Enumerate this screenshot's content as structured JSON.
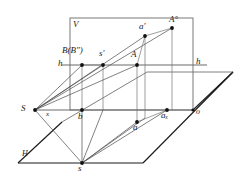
{
  "figure": {
    "type": "descriptive-geometry-diagram",
    "background_color": "#ffffff",
    "line_color": "#3c3c3c",
    "heavy_line_color": "#1a1a1a",
    "point_color": "#111111",
    "label_color": "#1a1a1a"
  },
  "planes": {
    "picture_plane": {
      "label": "V",
      "label_x": 73,
      "label_y": 20,
      "rect": {
        "x": 70,
        "y": 18,
        "w": 123,
        "h": 92
      }
    },
    "ground_plane": {
      "label": "H",
      "label_x": 22,
      "label_y": 152,
      "polygon": "193,110 233,72 147,72 18,163 143,163"
    }
  },
  "lines": {
    "horizon": {
      "label_left": "h",
      "label_right": "h",
      "left_label_x": 59,
      "left_label_y": 60,
      "right_label_x": 196,
      "right_label_y": 58,
      "y": 65,
      "x_start": 62,
      "x_end": 207
    },
    "ground_line": {
      "label": "x",
      "label_x": 47,
      "label_y": 113,
      "y": 110,
      "x_start": 35,
      "x_end": 193
    },
    "origin": {
      "label": "o",
      "label_x": 196,
      "label_y": 110
    }
  },
  "points": [
    {
      "id": "S",
      "label": "S",
      "x": 35,
      "y": 110,
      "label_x": 22,
      "label_y": 106,
      "size": 9,
      "sup": "",
      "sub": "",
      "paren": ""
    },
    {
      "id": "B",
      "label": "B",
      "x": 82,
      "y": 65,
      "label_x": 63,
      "label_y": 48,
      "size": 9,
      "sup": "",
      "sub": "",
      "paren": "(B″)"
    },
    {
      "id": "sprime",
      "label": "s",
      "x": 103,
      "y": 65,
      "label_x": 100,
      "label_y": 50,
      "size": 9,
      "sup": "′",
      "sub": "",
      "paren": ""
    },
    {
      "id": "A",
      "label": "A",
      "x": 137,
      "y": 65,
      "label_x": 132,
      "label_y": 51,
      "size": 9,
      "sup": "",
      "sub": "",
      "paren": ""
    },
    {
      "id": "aprime",
      "label": "a",
      "x": 145,
      "y": 36,
      "label_x": 140,
      "label_y": 24,
      "size": 9,
      "sup": "′",
      "sub": "",
      "paren": ""
    },
    {
      "id": "Acirc",
      "label": "A",
      "x": 172,
      "y": 28,
      "label_x": 170,
      "label_y": 16,
      "size": 9,
      "sup": "°",
      "sub": "",
      "paren": ""
    },
    {
      "id": "b",
      "label": "b",
      "x": 82,
      "y": 110,
      "label_x": 80,
      "label_y": 113,
      "size": 9,
      "sup": "",
      "sub": "",
      "paren": ""
    },
    {
      "id": "a",
      "label": "a",
      "x": 137,
      "y": 122,
      "label_x": 134,
      "label_y": 124,
      "size": 9,
      "sup": "",
      "sub": "",
      "paren": ""
    },
    {
      "id": "ax",
      "label": "a",
      "x": 167,
      "y": 110,
      "label_x": 163,
      "label_y": 113,
      "size": 9,
      "sup": "",
      "sub": "x",
      "paren": ""
    },
    {
      "id": "s",
      "label": "s",
      "x": 82,
      "y": 163,
      "label_x": 79,
      "label_y": 166,
      "size": 9,
      "sup": "",
      "sub": "",
      "paren": ""
    }
  ],
  "label_texts": {
    "V": "V",
    "H": "H",
    "h_left": "h",
    "h_right": "h",
    "x": "x",
    "o": "o",
    "S": "S",
    "B_group": "B(B″)",
    "s_prime": "s′",
    "A": "A",
    "a_prime": "a′",
    "A_circ": "A°",
    "b": "b",
    "a": "a",
    "a_x": "aₓ",
    "s": "s"
  }
}
